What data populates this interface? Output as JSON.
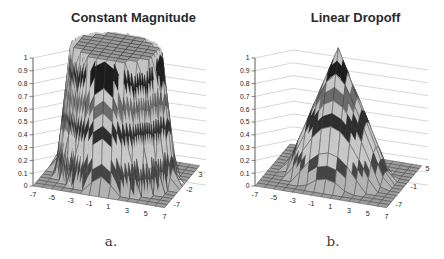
{
  "figure": {
    "background": "#ffffff"
  },
  "chart_data": [
    {
      "type": "surface3d",
      "title": "Constant Magnitude",
      "caption": "a.",
      "x_range": [
        -7,
        7
      ],
      "y_range": [
        -7,
        7
      ],
      "z_range": [
        0,
        1
      ],
      "grid_step": 1,
      "x_tick_labels": [
        "-7",
        "-5",
        "-3",
        "-1",
        "1",
        "3",
        "5",
        "7"
      ],
      "y_tick_labels": [
        "-7",
        "-2",
        "3"
      ],
      "z_tick_labels": [
        "0",
        "0.1",
        "0.2",
        "0.3",
        "0.4",
        "0.5",
        "0.6",
        "0.7",
        "0.8",
        "0.9",
        "1"
      ],
      "grid": "back-wall-z-gridlines",
      "legend_position": "none",
      "surface": {
        "kind": "plateau",
        "description": "flat-topped cylinder: magnitude 1 inside radius, dropping to 0 at outer radius",
        "formula": "z(x,y) = clamp((6.2 - sqrt(x^2+y^2)) / 1.5, 0, 1)",
        "inner_radius": 4.7,
        "outer_radius": 6.2,
        "peak_value": 1,
        "floor_value": 0
      }
    },
    {
      "type": "surface3d",
      "title": "Linear Dropoff",
      "caption": "b.",
      "x_range": [
        -7,
        7
      ],
      "y_range": [
        -7,
        7
      ],
      "z_range": [
        0,
        1
      ],
      "grid_step": 1,
      "x_tick_labels": [
        "-7",
        "-5",
        "-3",
        "-1",
        "1",
        "3",
        "5",
        "7"
      ],
      "y_tick_labels": [
        "-7",
        "-1",
        "5"
      ],
      "z_tick_labels": [
        "0",
        "0.1",
        "0.2",
        "0.3",
        "0.4",
        "0.5",
        "0.6",
        "0.7",
        "0.8",
        "0.9",
        "1"
      ],
      "grid": "back-wall-z-gridlines",
      "legend_position": "none",
      "surface": {
        "kind": "cone",
        "description": "cone: magnitude 1 at center dropping linearly to 0 at base radius",
        "formula": "z(x,y) = max(0, 1 - sqrt(x^2+y^2)/5.5)",
        "base_radius": 5.5,
        "peak_value": 1,
        "floor_value": 0
      }
    }
  ],
  "colormap": {
    "description": "grayscale contour bands keyed by z value (0.1 per band)",
    "bands": [
      {
        "z": [
          0.0,
          0.1
        ],
        "color": "#b2b2b2"
      },
      {
        "z": [
          0.1,
          0.2
        ],
        "color": "#454545"
      },
      {
        "z": [
          0.2,
          0.3
        ],
        "color": "#c8c8c8"
      },
      {
        "z": [
          0.3,
          0.4
        ],
        "color": "#c8c8c8"
      },
      {
        "z": [
          0.4,
          0.5
        ],
        "color": "#2d2d2d"
      },
      {
        "z": [
          0.5,
          0.6
        ],
        "color": "#c2c2c2"
      },
      {
        "z": [
          0.6,
          0.7
        ],
        "color": "#6b6b6b"
      },
      {
        "z": [
          0.7,
          0.8
        ],
        "color": "#c8c8c8"
      },
      {
        "z": [
          0.8,
          0.9
        ],
        "color": "#1c1c1c"
      },
      {
        "z": [
          0.9,
          1.0
        ],
        "color": "#c4c4c4"
      }
    ],
    "flat_top_color": "#9a9a9a",
    "floor_color": "#9c9c9c",
    "mesh_line_color": "#3a3a3a",
    "wall_grid_color": "#bcbcbc",
    "axis_color": "#4a4a4a",
    "text_color": "#222222"
  }
}
